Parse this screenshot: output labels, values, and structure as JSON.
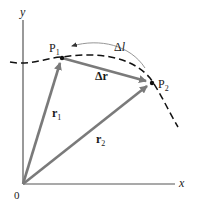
{
  "diagram": {
    "axes": {
      "x_label": "x",
      "y_label": "y",
      "origin_label": "0"
    },
    "points": [
      {
        "id": "P1",
        "label": "P",
        "subscript": "1"
      },
      {
        "id": "P2",
        "label": "P",
        "subscript": "2"
      }
    ],
    "vectors": [
      {
        "id": "r1",
        "label": "r",
        "subscript": "1",
        "from": "O",
        "to": "P1"
      },
      {
        "id": "r2",
        "label": "r",
        "subscript": "2",
        "from": "O",
        "to": "P2"
      },
      {
        "id": "delta_r",
        "label": "Δr",
        "from": "P1",
        "to": "P2"
      }
    ],
    "arc": {
      "label": "Δl",
      "label_prefix": "Δ",
      "label_var": "l",
      "from": "P2",
      "to": "P1"
    },
    "path": {
      "style": "dashed",
      "description": "particle trajectory"
    },
    "colors": {
      "axis": "#555555",
      "vector": "#7a7a7a",
      "path": "#111111",
      "arc": "#8a8a8a",
      "text": "#1a1a1a"
    }
  }
}
